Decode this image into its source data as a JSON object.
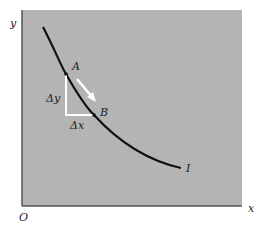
{
  "diagram": {
    "axes": {
      "y_label": "y",
      "x_label": "x",
      "origin_label": "O"
    },
    "curve": {
      "label": "I"
    },
    "points": {
      "a_label": "A",
      "b_label": "B"
    },
    "deltas": {
      "dy_label": "Δy",
      "dx_label": "Δx"
    },
    "colors": {
      "plot_bg": "#b4b4b4",
      "curve": "#111111",
      "triangle": "#ffffff",
      "axis": "#555555"
    }
  }
}
